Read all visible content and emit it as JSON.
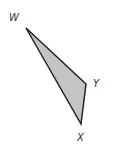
{
  "diagram": {
    "type": "triangle",
    "fill": "#c4c4c4",
    "stroke": "#222222",
    "vertices": [
      {
        "name": "W",
        "x": 26,
        "y": 28,
        "label_x": 9,
        "label_y": 21
      },
      {
        "name": "Y",
        "x": 86,
        "y": 84,
        "label_x": 93,
        "label_y": 87
      },
      {
        "name": "X",
        "x": 81,
        "y": 124,
        "label_x": 77,
        "label_y": 141
      }
    ],
    "labels": {
      "w": "W",
      "y": "Y",
      "x": "X"
    }
  }
}
